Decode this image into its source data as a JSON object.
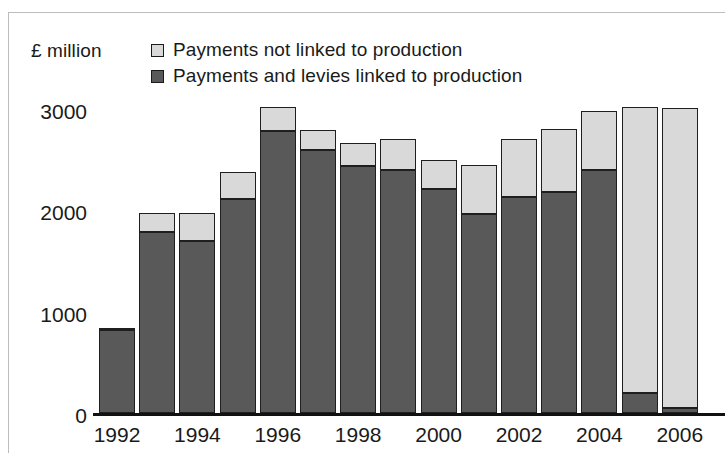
{
  "axis_unit": "£ million",
  "legend": {
    "entries": [
      {
        "label": "Payments not linked to production",
        "color": "#d9d9d9",
        "key": "not_linked"
      },
      {
        "label": "Payments and levies linked to production",
        "color": "#595959",
        "key": "linked"
      }
    ]
  },
  "yticks": [
    "0",
    "1000",
    "2000",
    "3000"
  ],
  "xticks": [
    "1992",
    "1994",
    "1996",
    "1998",
    "2000",
    "2002",
    "2004",
    "2006"
  ],
  "chart_data": {
    "type": "bar",
    "subtype": "stacked-column",
    "title": "",
    "subtitle": "",
    "xlabel": "",
    "ylabel": "£ million",
    "ylim": [
      0,
      3100
    ],
    "ytick_values": [
      0,
      1000,
      2000,
      3000
    ],
    "grid": false,
    "legend_position": "top-center",
    "categories": [
      "1992",
      "1993",
      "1994",
      "1995",
      "1996",
      "1997",
      "1998",
      "1999",
      "2000",
      "2001",
      "2002",
      "2003",
      "2004",
      "2005",
      "2006"
    ],
    "xtick_labels_shown": [
      "1992",
      "1994",
      "1996",
      "1998",
      "2000",
      "2002",
      "2004",
      "2006"
    ],
    "series": [
      {
        "name": "Payments and levies linked to production",
        "color": "#595959",
        "values": [
          820,
          1790,
          1700,
          2110,
          2780,
          2600,
          2440,
          2400,
          2210,
          1960,
          2130,
          2180,
          2400,
          200,
          50
        ]
      },
      {
        "name": "Payments not linked to production",
        "color": "#d9d9d9",
        "values": [
          20,
          180,
          270,
          270,
          240,
          190,
          220,
          300,
          290,
          490,
          570,
          620,
          580,
          2820,
          2960
        ]
      }
    ],
    "totals": [
      840,
      1970,
      1970,
      2380,
      3020,
      2790,
      2660,
      2700,
      2500,
      2450,
      2700,
      2800,
      2980,
      3020,
      3010
    ]
  }
}
